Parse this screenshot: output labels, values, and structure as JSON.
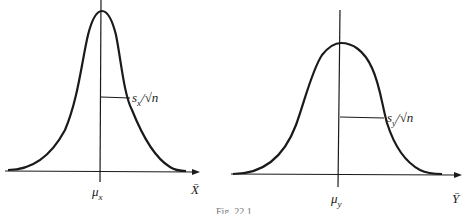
{
  "figure": {
    "caption": "Fig. 22.1",
    "panels": [
      {
        "id": "left",
        "mean_label": "μ",
        "mean_sub": "x",
        "axis_label": "X̄",
        "se_label_s": "s",
        "se_label_sub": "x",
        "se_label_rest": "/√n"
      },
      {
        "id": "right",
        "mean_label": "μ",
        "mean_sub": "y",
        "axis_label": "Ȳ",
        "se_label_s": "s",
        "se_label_sub": "y",
        "se_label_rest": "/√n"
      }
    ]
  },
  "colors": {
    "ink": "#1a1a1a",
    "background": "#ffffff"
  }
}
